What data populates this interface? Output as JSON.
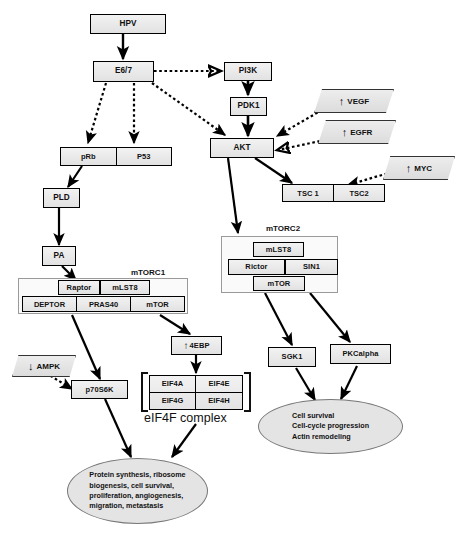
{
  "diagram": {
    "colors": {
      "node_fill": "#eaeaea",
      "node_stroke": "#000000",
      "complex_stroke": "#9a9a9a",
      "ellipse_fill": "#e4e4e4",
      "ellipse_stroke": "#777777"
    }
  },
  "nodes": {
    "hpv": "HPV",
    "e67": "E6/7",
    "pi3k": "PI3K",
    "pdk1": "PDK1",
    "akt": "AKT",
    "prb": "pRb",
    "p53": "P53",
    "pld": "PLD",
    "pa": "PA",
    "tsc1": "TSC 1",
    "tsc2": "TSC2",
    "p70s6k": "p70S6K",
    "fourebp": "4EBP",
    "sgk1": "SGK1",
    "pkcalpha": "PKCalpha"
  },
  "regulators": [
    {
      "id": "vegf",
      "label": "VEGF",
      "direction": "up",
      "glyph": "↑"
    },
    {
      "id": "egfr",
      "label": "EGFR",
      "direction": "up",
      "glyph": "↑"
    },
    {
      "id": "myc",
      "label": "MYC",
      "direction": "up",
      "glyph": "↑"
    },
    {
      "id": "ampk",
      "label": "AMPK",
      "direction": "down",
      "glyph": "↓"
    }
  ],
  "complexes": {
    "mtorc1": {
      "label": "mTORC1",
      "top_row": [
        "Raptor",
        "mLST8"
      ],
      "bottom_row": [
        "DEPTOR",
        "PRAS40",
        "mTOR"
      ]
    },
    "mtorc2": {
      "label": "mTORC2",
      "top": "mLST8",
      "middle": [
        "Rictor",
        "SIN1"
      ],
      "bottom": "mTOR"
    }
  },
  "eif4f": {
    "caption": "eIF4F complex",
    "cells": [
      "EIF4A",
      "EIF4E",
      "EIF4G",
      "EIF4H"
    ]
  },
  "outcomes": {
    "left": {
      "lines": [
        "Protein synthesis, ribosome",
        "biogenesis, cell survival,",
        "proliferation, angiogenesis,",
        "migration, metastasis"
      ]
    },
    "right": {
      "lines": [
        "Cell survival",
        "Cell-cycle progression",
        "Actin remodeling"
      ]
    }
  },
  "edges": [
    {
      "from": "HPV",
      "to": "E6/7",
      "style": "solid"
    },
    {
      "from": "E6/7",
      "to": "PI3K",
      "style": "dotted"
    },
    {
      "from": "E6/7",
      "to": "pRb",
      "style": "dotted"
    },
    {
      "from": "E6/7",
      "to": "P53",
      "style": "dotted"
    },
    {
      "from": "E6/7",
      "to": "AKT",
      "style": "dotted"
    },
    {
      "from": "PI3K",
      "to": "PDK1",
      "style": "solid"
    },
    {
      "from": "PDK1",
      "to": "AKT",
      "style": "solid"
    },
    {
      "from": "VEGF",
      "to": "AKT",
      "style": "dotted"
    },
    {
      "from": "EGFR",
      "to": "AKT",
      "style": "dotted"
    },
    {
      "from": "MYC",
      "to": "TSC2",
      "style": "dotted"
    },
    {
      "from": "pRb",
      "to": "PLD",
      "style": "solid"
    },
    {
      "from": "PLD",
      "to": "PA",
      "style": "solid"
    },
    {
      "from": "PA",
      "to": "mTORC1",
      "style": "solid"
    },
    {
      "from": "AKT",
      "to": "TSC 1",
      "style": "solid"
    },
    {
      "from": "AKT",
      "to": "mTORC2",
      "style": "solid"
    },
    {
      "from": "mTORC1",
      "to": "p70S6K",
      "style": "solid"
    },
    {
      "from": "mTORC1",
      "to": "4EBP",
      "style": "solid"
    },
    {
      "from": "AMPK",
      "to": "p70S6K",
      "style": "dotted"
    },
    {
      "from": "4EBP",
      "to": "eIF4F",
      "style": "solid"
    },
    {
      "from": "p70S6K",
      "to": "outcome-left",
      "style": "solid"
    },
    {
      "from": "eIF4F",
      "to": "outcome-left",
      "style": "solid"
    },
    {
      "from": "mTORC2",
      "to": "SGK1",
      "style": "solid"
    },
    {
      "from": "mTORC2",
      "to": "PKCalpha",
      "style": "solid"
    },
    {
      "from": "SGK1",
      "to": "outcome-right",
      "style": "solid"
    },
    {
      "from": "PKCalpha",
      "to": "outcome-right",
      "style": "solid"
    }
  ]
}
